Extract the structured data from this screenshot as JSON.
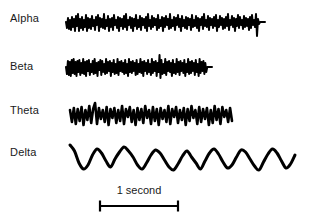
{
  "figure": {
    "background_color": "#ffffff",
    "trace_color": "#000000",
    "text_color": "#1a1a1a",
    "width": 309,
    "height": 222
  },
  "labels": {
    "alpha": "Alpha",
    "beta": "Beta",
    "theta": "Theta",
    "delta": "Delta"
  },
  "scale_bar": {
    "caption": "1 second",
    "x_start": 100,
    "x_end": 178,
    "y": 206,
    "tick_height": 11
  },
  "chart_data": {
    "type": "line",
    "xlabel": "",
    "ylabel": "",
    "grid": false,
    "legend": "none",
    "annotations": [
      "1 second"
    ],
    "series": [
      {
        "name": "Alpha",
        "label": "Alpha",
        "baseline_y": 22,
        "x_start": 66,
        "x_end": 265,
        "stroke_width": 2.0,
        "flat_tail_from": 255,
        "amplitude": 9,
        "values": [
          0,
          -6,
          4,
          -7,
          2,
          -8,
          5,
          -5,
          3,
          -9,
          6,
          -4,
          8,
          -9,
          3,
          -6,
          5,
          -8,
          2,
          -5,
          7,
          -9,
          4,
          -6,
          3,
          -7,
          6,
          -4,
          2,
          -8,
          5,
          -3,
          7,
          -9,
          4,
          -5,
          3,
          -6,
          8,
          -7,
          2,
          -4,
          6,
          -9,
          3,
          -5,
          4,
          -8,
          7,
          -3,
          2,
          -6,
          5,
          -9,
          4,
          -4,
          3,
          -7,
          6,
          -5,
          8,
          -8,
          2,
          -3,
          5,
          -6,
          4,
          -9,
          3,
          -4,
          7,
          -7,
          2,
          -5,
          6,
          -8,
          4,
          -3,
          3,
          -6,
          5,
          -9,
          8,
          -4,
          2,
          -7,
          6,
          -5,
          4,
          -3,
          3,
          -8,
          7,
          -6,
          2,
          -4,
          5,
          -9,
          4,
          -5,
          6,
          -3,
          3,
          -7,
          8,
          -6,
          2,
          -4,
          5,
          -8,
          4,
          -3,
          7,
          -5,
          3,
          -9,
          6,
          -4,
          2,
          -6,
          5,
          -7,
          4,
          -3,
          3,
          -8,
          7,
          -5,
          2,
          -4,
          6,
          -6,
          4,
          -9,
          3,
          -3,
          5,
          -7,
          8,
          -4,
          2,
          -5,
          6,
          -8,
          4,
          -3,
          3,
          -6,
          5,
          -4,
          7,
          -9,
          2,
          -5,
          6,
          -3,
          4,
          -7,
          3,
          -6,
          5,
          -4,
          8,
          -8,
          2,
          -3,
          6,
          -5,
          4,
          -9,
          3,
          -4,
          7,
          -6,
          5,
          -3,
          2,
          -7,
          6,
          -5,
          4,
          -4,
          3,
          -8,
          5,
          -6,
          7,
          -3,
          2,
          -5,
          8,
          -14,
          3,
          -2,
          0,
          0,
          0,
          0,
          0,
          0
        ]
      },
      {
        "name": "Beta",
        "label": "Beta",
        "baseline_y": 67,
        "x_start": 66,
        "x_end": 212,
        "stroke_width": 2.0,
        "flat_tail_from": 203,
        "amplitude": 8,
        "values": [
          0,
          -7,
          6,
          -8,
          5,
          -9,
          7,
          -6,
          8,
          -7,
          5,
          -9,
          6,
          -5,
          7,
          -8,
          4,
          -6,
          8,
          -7,
          5,
          -9,
          6,
          -4,
          7,
          -8,
          3,
          -5,
          6,
          -7,
          8,
          -6,
          4,
          -9,
          5,
          -3,
          7,
          -8,
          6,
          -5,
          3,
          -7,
          8,
          -6,
          5,
          -4,
          6,
          -9,
          4,
          -5,
          7,
          -7,
          3,
          -6,
          8,
          -8,
          5,
          -4,
          6,
          -5,
          4,
          -7,
          7,
          -6,
          3,
          -9,
          8,
          -5,
          5,
          -6,
          6,
          -4,
          4,
          -8,
          7,
          -7,
          3,
          -5,
          8,
          -6,
          5,
          -9,
          6,
          -4,
          4,
          -7,
          7,
          -5,
          3,
          -8,
          8,
          -6,
          5,
          -4,
          6,
          -9,
          4,
          -5,
          12,
          -11,
          7,
          -7,
          3,
          -6,
          8,
          -8,
          5,
          -4,
          6,
          -5,
          4,
          -9,
          7,
          -6,
          3,
          -7,
          8,
          -5,
          5,
          -8,
          6,
          -4,
          4,
          -6,
          7,
          -9,
          3,
          -5,
          8,
          -7,
          5,
          -6,
          6,
          -4,
          4,
          -8,
          7,
          -5,
          3,
          -9,
          8,
          -6,
          5,
          -4,
          6,
          -7,
          4,
          -5,
          0,
          0,
          0,
          0,
          0,
          0
        ]
      },
      {
        "name": "Theta",
        "label": "Theta",
        "baseline_y": 112,
        "x_start": 70,
        "x_end": 232,
        "stroke_width": 2.6,
        "flat_tail_from": 232,
        "amplitude": 13,
        "values": [
          2,
          -10,
          4,
          -12,
          3,
          -9,
          5,
          -13,
          2,
          -8,
          6,
          -11,
          3,
          9,
          -12,
          4,
          -7,
          2,
          -10,
          5,
          -13,
          3,
          -6,
          4,
          -11,
          2,
          -9,
          6,
          -12,
          3,
          -5,
          5,
          -10,
          2,
          -13,
          4,
          -8,
          3,
          -11,
          6,
          -6,
          2,
          -12,
          5,
          -9,
          3,
          -13,
          4,
          -7,
          2,
          -10,
          6,
          -12,
          3,
          -5,
          5,
          -11,
          2,
          -8,
          4,
          -13,
          3,
          -9,
          6,
          -6,
          2,
          -12,
          5,
          -10,
          3,
          -7,
          4,
          -13,
          2,
          -11,
          6,
          -8,
          3,
          -12,
          5,
          -5,
          2,
          -10,
          4,
          -9
        ]
      },
      {
        "name": "Delta",
        "label": "Delta",
        "baseline_y": 155,
        "x_start": 70,
        "x_end": 295,
        "stroke_width": 3.0,
        "flat_tail_from": 295,
        "amplitude": 16,
        "values": [
          10,
          4,
          -8,
          -14,
          -10,
          0,
          6,
          2,
          -6,
          -12,
          -4,
          3,
          8,
          4,
          -2,
          -10,
          -14,
          -8,
          0,
          5,
          2,
          -5,
          -12,
          -15,
          -9,
          -1,
          4,
          -2,
          -8,
          -14,
          -6,
          2,
          6,
          1,
          -7,
          -13,
          -10,
          -2,
          5,
          3,
          -4,
          -11,
          -15,
          -7,
          1,
          6,
          2,
          -6,
          -13,
          -9,
          0
        ]
      }
    ]
  }
}
